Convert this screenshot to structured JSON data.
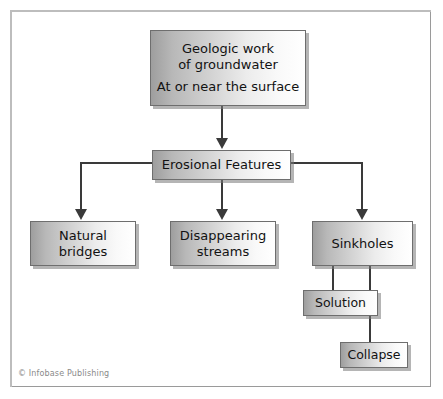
{
  "figure": {
    "width": 443,
    "height": 399,
    "background_color": "#ffffff",
    "frame_border_color": "#9a9a9a"
  },
  "diagram": {
    "type": "flowchart",
    "orientation": "top-down",
    "box_fill_gradient": "#9e9e9e to #ffffff (left to right)",
    "box_border_color": "#6e6e6e",
    "connector_color": "#3a3a3a",
    "nodes": [
      {
        "id": "root",
        "lines": [
          "Geologic work",
          "of groundwater",
          "At or near the surface"
        ],
        "line1": "Geologic work",
        "line2": "of groundwater",
        "line3": "At or near the surface"
      },
      {
        "id": "erosional",
        "label": "Erosional Features"
      },
      {
        "id": "natural-bridges",
        "line1": "Natural",
        "line2": "bridges"
      },
      {
        "id": "disappearing-streams",
        "line1": "Disappearing",
        "line2": "streams"
      },
      {
        "id": "sinkholes",
        "label": "Sinkholes"
      },
      {
        "id": "solution",
        "label": "Solution"
      },
      {
        "id": "collapse",
        "label": "Collapse"
      }
    ],
    "edges": [
      {
        "from": "root",
        "to": "erosional",
        "style": "arrow"
      },
      {
        "from": "erosional",
        "to": "natural-bridges",
        "style": "arrow"
      },
      {
        "from": "erosional",
        "to": "disappearing-streams",
        "style": "arrow"
      },
      {
        "from": "erosional",
        "to": "sinkholes",
        "style": "arrow"
      },
      {
        "from": "sinkholes",
        "to": "solution",
        "style": "plain-line"
      },
      {
        "from": "sinkholes",
        "to": "collapse",
        "style": "plain-line"
      }
    ]
  },
  "credit": {
    "text": "© Infobase Publishing"
  }
}
